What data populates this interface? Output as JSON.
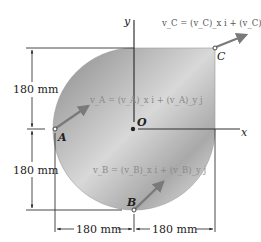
{
  "diagram": {
    "axes": {
      "x_label": "x",
      "y_label": "y",
      "origin_label": "O"
    },
    "points": {
      "A": {
        "label": "A"
      },
      "B": {
        "label": "B"
      },
      "C": {
        "label": "C"
      }
    },
    "vectors": {
      "vA": "v_A = (v_A)_x i + (v_A)_y j",
      "vB": "v_B = (v_B)_x i + (v_B)_y j",
      "vC": "v_C = (v_C)_x i + (v_C)_y j"
    },
    "dimensions": {
      "left_upper": "180 mm",
      "left_lower": "180 mm",
      "bottom_left": "180 mm",
      "bottom_right": "180 mm"
    },
    "colors": {
      "plate_dark": "#8f8f8f",
      "plate_light": "#e2e2e2",
      "arrow": "#7a7a7a",
      "line": "#333333",
      "vec_text_light": "#8a8a8a",
      "vec_text_dark": "#555555"
    }
  }
}
